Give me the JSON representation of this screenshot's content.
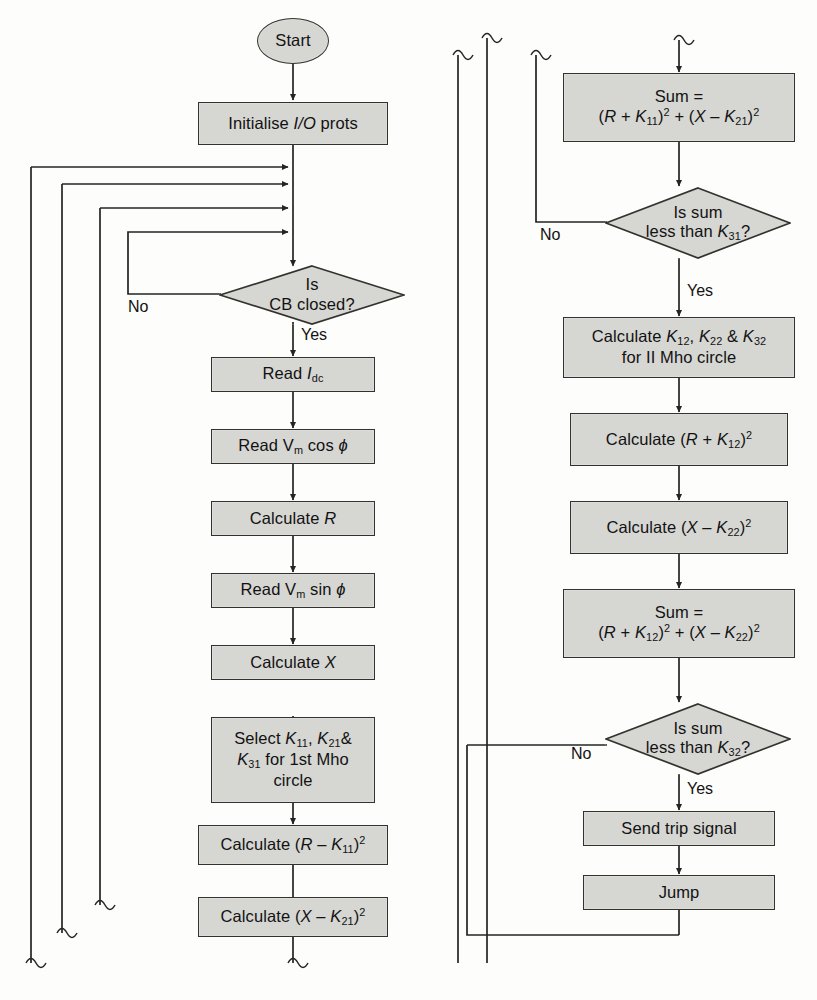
{
  "diagram": {
    "style": {
      "node_fill": "#d6d6d2",
      "node_stroke": "#33322f",
      "page_background": "#fdfdfb",
      "text_color": "#121212"
    },
    "nodes": [
      {
        "id": "start",
        "shape": "terminator",
        "text": "Start"
      },
      {
        "id": "init",
        "shape": "process",
        "text": "Initialise I/O prots"
      },
      {
        "id": "cb",
        "shape": "decision",
        "line1": "Is",
        "line2": "CB closed?"
      },
      {
        "id": "read_idc",
        "shape": "process",
        "text": "Read Idc"
      },
      {
        "id": "read_vcos",
        "shape": "process",
        "text": "Read Vm cos ϕ"
      },
      {
        "id": "calc_r",
        "shape": "process",
        "text": "Calculate R"
      },
      {
        "id": "read_vsin",
        "shape": "process",
        "text": "Read Vm sin ϕ"
      },
      {
        "id": "calc_x",
        "shape": "process",
        "text": "Calculate X"
      },
      {
        "id": "select_k1",
        "shape": "process",
        "line1": "Select K11, K21&",
        "line2": "K31 for 1st Mho",
        "line3": "circle"
      },
      {
        "id": "calc_rk11",
        "shape": "process",
        "text": "Calculate (R − K11)2"
      },
      {
        "id": "calc_xk21",
        "shape": "process",
        "text": "Calculate (X − K21)2"
      },
      {
        "id": "sum1",
        "shape": "process",
        "line1": "Sum =",
        "line2": "(R + K11)2 + (X − K21)2"
      },
      {
        "id": "dec_sum1",
        "shape": "decision",
        "line1": "Is sum",
        "line2": "less than K31?"
      },
      {
        "id": "calc_k2",
        "shape": "process",
        "line1": "Calculate K12, K22 & K32",
        "line2": "for II Mho circle"
      },
      {
        "id": "calc_rk12",
        "shape": "process",
        "text": "Calculate (R + K12)2"
      },
      {
        "id": "calc_xk22",
        "shape": "process",
        "text": "Calculate (X − K22)2"
      },
      {
        "id": "sum2",
        "shape": "process",
        "line1": "Sum =",
        "line2": "(R + K12)2 + (X − K22)2"
      },
      {
        "id": "dec_sum2",
        "shape": "decision",
        "line1": "Is sum",
        "line2": "less than K32?"
      },
      {
        "id": "trip",
        "shape": "process",
        "text": "Send trip signal"
      },
      {
        "id": "jump",
        "shape": "process",
        "text": "Jump"
      }
    ],
    "edge_labels": {
      "cb_no": "No",
      "cb_yes": "Yes",
      "sum1_no": "No",
      "sum1_yes": "Yes",
      "sum2_no": "No",
      "sum2_yes": "Yes"
    }
  }
}
